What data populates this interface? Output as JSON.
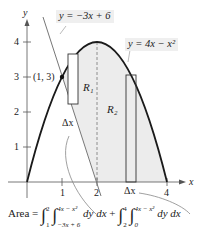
{
  "figure": {
    "type": "area-between-curves",
    "curves": [
      {
        "name": "line",
        "label": "y = −3x + 6"
      },
      {
        "name": "parabola",
        "label": "y = 4x − x²"
      }
    ],
    "point_label": "(1, 3)",
    "region_labels": [
      "R₁",
      "R₂"
    ],
    "delta_x_label": "Δx",
    "axis_labels": {
      "x": "x",
      "y": "y"
    },
    "x_ticks": [
      "1",
      "2",
      "4"
    ],
    "y_ticks": [
      "1",
      "2",
      "3",
      "4"
    ],
    "colors": {
      "shade": "#ececec",
      "curve": "#1a1a1a",
      "line": "#777777",
      "callout": "#efefef"
    }
  },
  "formula": {
    "prefix": "Area =",
    "int1_lower": "1",
    "int1_upper": "2",
    "inner1_lower": "−3x + 6",
    "inner1_upper": "4x − x²",
    "term1": "dy dx",
    "plus": "+",
    "int2_lower": "2",
    "int2_upper": "4",
    "inner2_lower": "0",
    "inner2_upper": "4x − x²",
    "term2": "dy dx"
  }
}
